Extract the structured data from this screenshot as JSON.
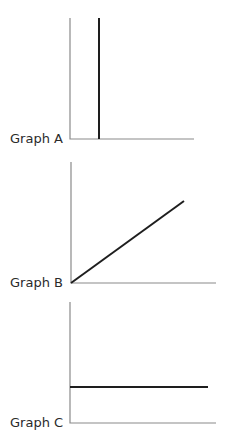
{
  "graphs": [
    {
      "label": "Graph A",
      "description": "Vertical line rising from x-axis near the origin",
      "axes": {
        "origin": [
          70,
          139
        ],
        "y_top": 18,
        "x_end": 194
      },
      "line": {
        "x1": 99,
        "y1": 139,
        "x2": 99,
        "y2": 18
      }
    },
    {
      "label": "Graph B",
      "description": "Straight line increasing from origin",
      "axes": {
        "origin": [
          71,
          283
        ],
        "y_top": 162,
        "x_end": 216
      },
      "line": {
        "x1": 71,
        "y1": 283,
        "x2": 184,
        "y2": 201
      }
    },
    {
      "label": "Graph C",
      "description": "Horizontal line at constant value",
      "axes": {
        "origin": [
          70,
          423
        ],
        "y_top": 302,
        "x_end": 216
      },
      "line": {
        "x1": 70,
        "y1": 387,
        "x2": 208,
        "y2": 387
      }
    }
  ],
  "colors": {
    "axis": "#8a8a8a",
    "line": "#1e1e1e",
    "text": "#2a2a2a"
  }
}
